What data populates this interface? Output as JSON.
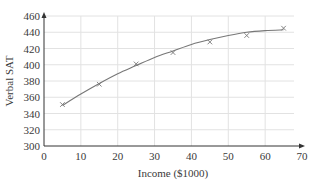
{
  "chart_data": {
    "type": "scatter",
    "title": "",
    "xlabel": "Income ($1000)",
    "ylabel": "Verbal SAT",
    "xlim": [
      0,
      70
    ],
    "ylim": [
      300,
      460
    ],
    "x_ticks": [
      0,
      10,
      20,
      30,
      40,
      50,
      60,
      70
    ],
    "y_ticks": [
      300,
      320,
      340,
      360,
      380,
      400,
      420,
      440,
      460
    ],
    "grid": true,
    "legend": null,
    "series": [
      {
        "name": "data",
        "marker": "x",
        "x": [
          5,
          15,
          25,
          35,
          45,
          55,
          65
        ],
        "y": [
          351,
          376,
          401,
          415,
          428,
          436,
          445
        ]
      },
      {
        "name": "fitted curve",
        "kind": "line",
        "x": [
          5,
          10,
          15,
          20,
          25,
          30,
          35,
          40,
          45,
          50,
          55,
          60,
          65
        ],
        "y": [
          350,
          364,
          377,
          389,
          399,
          409,
          417,
          425,
          431,
          436,
          440,
          442,
          443
        ]
      }
    ]
  },
  "colors": {
    "axis": "#333333",
    "grid": "#e2e2e2",
    "curve": "#777777",
    "marker": "#777777",
    "text": "#3a3a3a"
  }
}
